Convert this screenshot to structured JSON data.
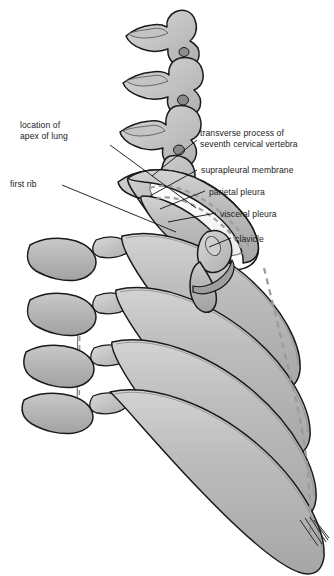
{
  "figure": {
    "name": "thoracic-inlet-rib-cage-anatomy",
    "background_color": "#ffffff",
    "bone_fill": "#b4b4b4",
    "bone_fill_light": "#d2d2d2",
    "bone_outline": "#1a1a1a",
    "apex_fill": "#fbfbfb",
    "pleura_dash_color": "#9a9a9a",
    "label_color": "#1b1b1b",
    "leader_color": "#111111"
  },
  "labels": {
    "left": [
      {
        "id": "apex-of-lung",
        "lines": [
          "location of",
          "apex of lung"
        ],
        "line1": "location of",
        "line2": "apex of lung",
        "x": 20,
        "y": 126
      },
      {
        "id": "first-rib",
        "lines": [
          "first rib"
        ],
        "line1": "first rib",
        "x": 10,
        "y": 180
      }
    ],
    "right": [
      {
        "id": "transverse-process-c7",
        "lines": [
          "transverse process of",
          "seventh cervical vertebra"
        ],
        "line1": "transverse process of",
        "line2": "seventh cervical vertebra",
        "x": 200,
        "y": 128
      },
      {
        "id": "suprapleural-membrane",
        "lines": [
          "suprapleural membrane"
        ],
        "line1": "suprapleural membrane",
        "x": 200,
        "y": 167
      },
      {
        "id": "parietal-pleura",
        "lines": [
          "parietal pleura"
        ],
        "line1": "parietal pleura",
        "x": 208,
        "y": 189
      },
      {
        "id": "visceral-pleura",
        "lines": [
          "visceral pleura"
        ],
        "line1": "visceral pleura",
        "x": 219,
        "y": 211
      },
      {
        "id": "clavicle",
        "lines": [
          "clavicle"
        ],
        "line1": "clavicle",
        "x": 234,
        "y": 237
      }
    ]
  },
  "structures": [
    {
      "id": "cervical-vertebrae",
      "label": "cervical vertebrae"
    },
    {
      "id": "thoracic-vertebrae",
      "label": "thoracic vertebrae"
    },
    {
      "id": "ribs",
      "label": "ribs"
    },
    {
      "id": "first-rib-shape",
      "label": "first rib"
    },
    {
      "id": "clavicle-shape",
      "label": "clavicle"
    },
    {
      "id": "apex-of-lung-shape",
      "label": "apex of lung"
    },
    {
      "id": "parietal-pleura-line",
      "label": "parietal pleura"
    },
    {
      "id": "visceral-pleura-line",
      "label": "visceral pleura"
    },
    {
      "id": "sternum-dashed-line",
      "label": "midline / sternum outline"
    }
  ]
}
